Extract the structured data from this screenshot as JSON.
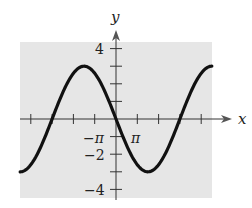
{
  "chart_data": {
    "type": "line",
    "title": "",
    "function": "y = -3 sin(x/3)",
    "xlabel": "x",
    "ylabel": "y",
    "xlim": [
      -4.5,
      4.5
    ],
    "xlim_units": "multiples of pi",
    "ylim": [
      -4.4,
      4.4
    ],
    "x_ticks": [
      -4,
      -3,
      -2,
      -1,
      1,
      2,
      3,
      4
    ],
    "x_tick_labels": [
      {
        "value": -1,
        "label": "−π"
      },
      {
        "value": 1,
        "label": "π"
      }
    ],
    "y_ticks": [
      -4,
      -3,
      -2,
      -1,
      1,
      2,
      3,
      4
    ],
    "y_tick_labels": [
      {
        "value": 4,
        "label": "4"
      },
      {
        "value": -2,
        "label": "−2"
      },
      {
        "value": -4,
        "label": "−4"
      }
    ],
    "grid": false,
    "background": "#e6e6e6",
    "line_color": "#111111",
    "series": [
      {
        "name": "y = -3 sin(x/3)",
        "x_pi": [
          -4.5,
          -3,
          -1.5,
          0,
          1.5,
          3,
          4.5
        ],
        "y": [
          3,
          0,
          3,
          0,
          -3,
          0,
          3
        ],
        "note": "x values in multiples of pi; y at x=-4.5pi is -3, corrected below"
      }
    ],
    "key_points": [
      {
        "x_pi": -4.5,
        "y": -3
      },
      {
        "x_pi": -3,
        "y": 0
      },
      {
        "x_pi": -1.5,
        "y": 3
      },
      {
        "x_pi": 0,
        "y": 0
      },
      {
        "x_pi": 1.5,
        "y": -3
      },
      {
        "x_pi": 3,
        "y": 0
      },
      {
        "x_pi": 4.5,
        "y": 3
      }
    ]
  },
  "labels": {
    "x_axis": "x",
    "y_axis": "y",
    "neg_pi": "−π",
    "pi": "π",
    "y4": "4",
    "yneg2": "−2",
    "yneg4": "−4"
  }
}
